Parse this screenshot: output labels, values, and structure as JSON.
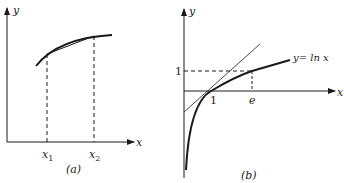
{
  "panel_a": {
    "caption": "(a)",
    "y_axis_label": "y",
    "x_axis_label": "x",
    "x1_label": "x",
    "x1_sub": "1",
    "x2_label": "x",
    "x2_sub": "2",
    "description": "concave curve with secant chord between x1 and x2"
  },
  "panel_b": {
    "caption": "(b)",
    "y_axis_label": "y",
    "x_axis_label": "x",
    "curve_label": "y= ln x",
    "y_tick_1": "1",
    "x_tick_1": "1",
    "x_tick_e": "e",
    "description": "graph of y = ln x with tangent line at x=1"
  },
  "colors": {
    "ink": "#1a1a1a",
    "background": "#ffffff"
  }
}
